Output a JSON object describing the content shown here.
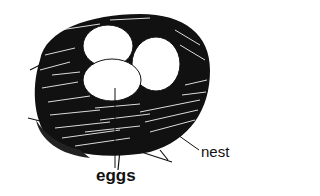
{
  "figure": {
    "labels": {
      "eggs": "eggs",
      "nest": "nest"
    },
    "egg_count": 3
  }
}
